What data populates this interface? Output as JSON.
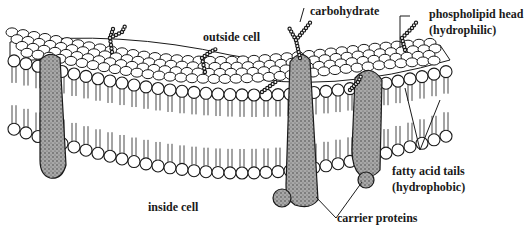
{
  "diagram": {
    "labels": {
      "outside_cell": "outside cell",
      "carbohydrate": "carbohydrate",
      "phospholipid_head_line1": "phospholipid head",
      "phospholipid_head_line2": "(hydrophilic)",
      "fatty_acid_line1": "fatty acid tails",
      "fatty_acid_line2": "(hydrophobic)",
      "inside_cell": "inside cell",
      "carrier_proteins": "carrier proteins"
    },
    "colors": {
      "ink": "#1a1a1a",
      "protein_fill": "#9a9a9a",
      "head_fill": "#ffffff",
      "background": "#ffffff"
    }
  }
}
